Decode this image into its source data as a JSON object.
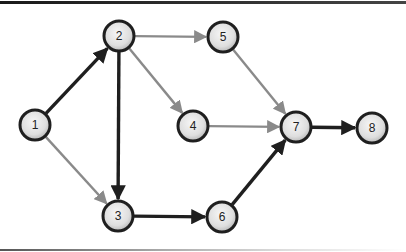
{
  "diagram": {
    "type": "directed-network",
    "colors": {
      "critical_edge": "#1f1f1f",
      "normal_edge": "#8a8a8a",
      "node_stroke": "#1f1f1f",
      "node_fill_center": "#f4f4f4",
      "node_fill_edge": "#bdbdbd"
    },
    "node_radius": 15,
    "nodes": [
      {
        "id": "1",
        "label": "1",
        "x": 35,
        "y": 125
      },
      {
        "id": "2",
        "label": "2",
        "x": 119,
        "y": 36
      },
      {
        "id": "3",
        "label": "3",
        "x": 118,
        "y": 216
      },
      {
        "id": "4",
        "label": "4",
        "x": 193,
        "y": 126
      },
      {
        "id": "5",
        "label": "5",
        "x": 223,
        "y": 37
      },
      {
        "id": "6",
        "label": "6",
        "x": 222,
        "y": 217
      },
      {
        "id": "7",
        "label": "7",
        "x": 296,
        "y": 127
      },
      {
        "id": "8",
        "label": "8",
        "x": 372,
        "y": 128
      }
    ],
    "edges": [
      {
        "from": "1",
        "to": "2",
        "critical": true
      },
      {
        "from": "1",
        "to": "3",
        "critical": false
      },
      {
        "from": "2",
        "to": "3",
        "critical": true
      },
      {
        "from": "2",
        "to": "4",
        "critical": false
      },
      {
        "from": "2",
        "to": "5",
        "critical": false
      },
      {
        "from": "3",
        "to": "6",
        "critical": true
      },
      {
        "from": "4",
        "to": "7",
        "critical": false
      },
      {
        "from": "5",
        "to": "7",
        "critical": false
      },
      {
        "from": "6",
        "to": "7",
        "critical": true
      },
      {
        "from": "7",
        "to": "8",
        "critical": true
      }
    ]
  }
}
